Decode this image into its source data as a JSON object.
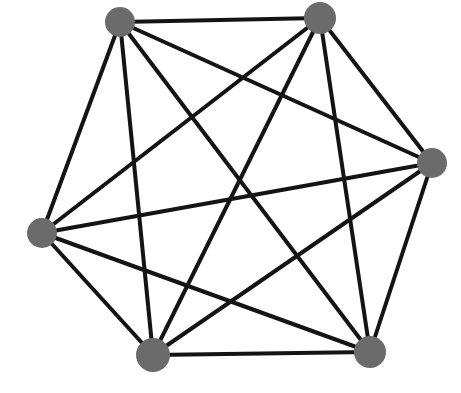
{
  "figure": {
    "kind": "graph-diagram",
    "title": "",
    "caption": "",
    "background_color": "#ffffff",
    "width": 461,
    "height": 393
  },
  "style": {
    "node_fill": "#6b6b6b",
    "node_stroke": "none",
    "edge_color": "#141414",
    "edge_width": 4
  },
  "chart_data": {
    "type": "graph",
    "graph_name": "K6",
    "node_count": 6,
    "edge_count": 15,
    "directed": false,
    "weighted": false,
    "labels_shown": false,
    "nodes": [
      {
        "id": "v1",
        "label": "",
        "x": 120,
        "y": 22,
        "r": 15,
        "degree": 5,
        "position_name": "top-left"
      },
      {
        "id": "v2",
        "label": "",
        "x": 320,
        "y": 18,
        "r": 16,
        "degree": 5,
        "position_name": "top-right"
      },
      {
        "id": "v3",
        "label": "",
        "x": 432,
        "y": 163,
        "r": 15,
        "degree": 5,
        "position_name": "right"
      },
      {
        "id": "v4",
        "label": "",
        "x": 370,
        "y": 352,
        "r": 16,
        "degree": 5,
        "position_name": "bottom-right"
      },
      {
        "id": "v5",
        "label": "",
        "x": 153,
        "y": 355,
        "r": 17,
        "degree": 5,
        "position_name": "bottom-left"
      },
      {
        "id": "v6",
        "label": "",
        "x": 42,
        "y": 233,
        "r": 15,
        "degree": 5,
        "position_name": "left"
      }
    ],
    "edges": [
      {
        "source": "v1",
        "target": "v2"
      },
      {
        "source": "v1",
        "target": "v3"
      },
      {
        "source": "v1",
        "target": "v4"
      },
      {
        "source": "v1",
        "target": "v5"
      },
      {
        "source": "v1",
        "target": "v6"
      },
      {
        "source": "v2",
        "target": "v3"
      },
      {
        "source": "v2",
        "target": "v4"
      },
      {
        "source": "v2",
        "target": "v5"
      },
      {
        "source": "v2",
        "target": "v6"
      },
      {
        "source": "v3",
        "target": "v4"
      },
      {
        "source": "v3",
        "target": "v5"
      },
      {
        "source": "v3",
        "target": "v6"
      },
      {
        "source": "v4",
        "target": "v5"
      },
      {
        "source": "v4",
        "target": "v6"
      },
      {
        "source": "v5",
        "target": "v6"
      }
    ]
  }
}
